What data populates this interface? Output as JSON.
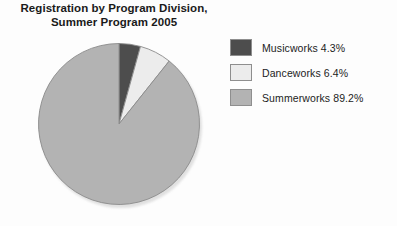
{
  "chart_data": {
    "type": "pie",
    "title": "Registration by Program Division, Summer Program 2005",
    "title_lines": [
      "Registration by Program Division,",
      "Summer Program 2005"
    ],
    "categories": [
      "Musicworks",
      "Danceworks",
      "Summerworks"
    ],
    "values": [
      4.3,
      6.4,
      89.2
    ],
    "value_unit": "%",
    "start_angle_deg": 0,
    "direction": "clockwise",
    "legend_position": "right",
    "grid": false,
    "xlabel": "",
    "ylabel": "",
    "colors": [
      "#4d4d4d",
      "#ececec",
      "#b3b3b3"
    ],
    "slice_border_color": "#8a8a8a",
    "legend_entries": [
      {
        "label": "Musicworks 4.3%",
        "name": "Musicworks",
        "value": 4.3,
        "color": "#4d4d4d"
      },
      {
        "label": "Danceworks 6.4%",
        "name": "Danceworks",
        "value": 6.4,
        "color": "#ececec"
      },
      {
        "label": "Summerworks 89.2%",
        "name": "Summerworks",
        "value": 89.2,
        "color": "#b3b3b3"
      }
    ]
  }
}
